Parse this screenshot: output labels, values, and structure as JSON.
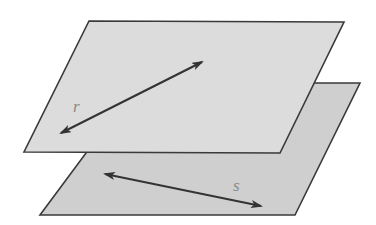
{
  "diagram": {
    "colors": {
      "background": "#ffffff",
      "upper_plane_fill": "#dcdcdc",
      "lower_plane_fill": "#cfcfcf",
      "edge": "#3a3a3a",
      "line": "#333333",
      "label": "#8a8a8a"
    },
    "planes": [
      {
        "name": "upper-plane",
        "points": "89,21 344,22 280,153 24,152"
      },
      {
        "name": "lower-plane",
        "points": "138,83 360,83 295,215 40,215"
      }
    ],
    "lines": [
      {
        "name": "line-r",
        "label": "r",
        "x1": 61,
        "y1": 133,
        "x2": 202,
        "y2": 62,
        "label_x": 73,
        "label_y": 112
      },
      {
        "name": "line-s",
        "label": "s",
        "x1": 105,
        "y1": 174,
        "x2": 261,
        "y2": 206,
        "label_x": 233,
        "label_y": 191
      }
    ]
  }
}
